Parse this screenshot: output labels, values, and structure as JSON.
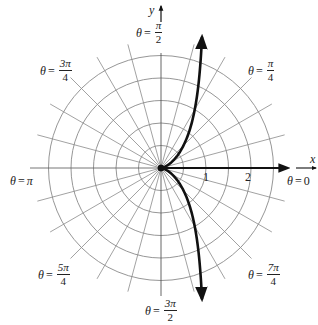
{
  "diagram": {
    "type": "polar-graph",
    "curve": "cissoid r = sin(θ)·tan(θ), vertical asymptote at x = 1",
    "colors": {
      "grid": "#888888",
      "curve": "#111111",
      "axis": "#111111",
      "background": "#ffffff"
    },
    "grid": {
      "circle_radii": [
        0.5,
        1,
        1.5,
        2,
        2.5
      ],
      "radial_step_degrees": 15
    },
    "axes": {
      "x_label": "x",
      "y_label": "y"
    },
    "ticks": [
      {
        "value": "1"
      },
      {
        "value": "2"
      }
    ],
    "angle_labels": {
      "theta_0": {
        "var": "θ",
        "eq": "=",
        "value": "0"
      },
      "theta_pi_4": {
        "var": "θ",
        "eq": "=",
        "num": "π",
        "den": "4"
      },
      "theta_pi_2": {
        "var": "θ",
        "eq": "=",
        "num": "π",
        "den": "2"
      },
      "theta_3pi_4": {
        "var": "θ",
        "eq": "=",
        "num": "3π",
        "den": "4"
      },
      "theta_pi": {
        "var": "θ",
        "eq": "=",
        "value": "π"
      },
      "theta_5pi_4": {
        "var": "θ",
        "eq": "=",
        "num": "5π",
        "den": "4"
      },
      "theta_3pi_2": {
        "var": "θ",
        "eq": "=",
        "num": "3π",
        "den": "2"
      },
      "theta_7pi_4": {
        "var": "θ",
        "eq": "=",
        "num": "7π",
        "den": "4"
      }
    }
  }
}
